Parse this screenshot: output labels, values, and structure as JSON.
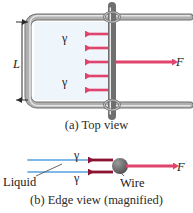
{
  "figure": {
    "colors": {
      "film": "#eef6fb",
      "wire_frame": "#9a9a9a",
      "wire_frame_highlight": "#d8d8d8",
      "force_arrow": "#e0436c",
      "gamma_arrow_edge": "#8c1330",
      "liquid_line": "#7fb8e6",
      "wire_dot": "#6e6e6e",
      "text": "#1c1c1c"
    }
  },
  "panel_a": {
    "caption": "(a) Top view",
    "dimension_label": "L",
    "gamma_label_top": "γ",
    "gamma_label_bottom": "γ",
    "force_label": "F",
    "surface_tension_arrow_count": 5,
    "arrow_direction": "left",
    "force_direction": "right"
  },
  "panel_b": {
    "caption": "(b) Edge view (magnified)",
    "gamma_label_top": "γ",
    "gamma_label_bottom": "γ",
    "force_label": "F",
    "liquid_label": "Liquid",
    "wire_label": "Wire",
    "surface_tension_arrow_count": 2,
    "arrow_direction": "left",
    "force_direction": "right"
  }
}
